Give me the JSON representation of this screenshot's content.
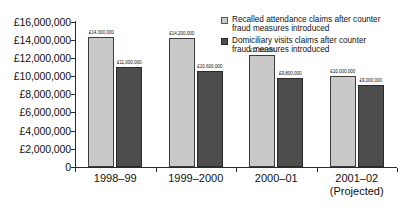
{
  "chart_data": {
    "type": "bar",
    "title": "",
    "xlabel": "",
    "ylabel": "",
    "ylim": [
      0,
      16000000
    ],
    "grid": false,
    "legend_position": "top-right",
    "categories": [
      "1998–99",
      "1999–2000",
      "2000–01",
      "2001–02 (Projected)"
    ],
    "category_lines": [
      [
        "1998–99"
      ],
      [
        "1999–2000"
      ],
      [
        "2000–01"
      ],
      [
        "2001–02",
        "(Projected)"
      ]
    ],
    "ytick_labels": [
      "£16,000,000",
      "£14,000,000",
      "£12,000,000",
      "£10,000,000",
      "£8,000,000",
      "£6,000,000",
      "£4,000,000",
      "£2,000,000",
      "0"
    ],
    "ytick_values": [
      16000000,
      14000000,
      12000000,
      10000000,
      8000000,
      6000000,
      4000000,
      2000000,
      0
    ],
    "series": [
      {
        "name": "Recalled attendance claims after counter fraud measures introduced",
        "color": "#c9c9c9",
        "values": [
          14300000,
          14200000,
          12300000,
          10000000
        ],
        "labels": [
          "£14,300,000",
          "£14,200,000",
          "£12,300,000",
          "£10,000,000"
        ]
      },
      {
        "name": "Domiciliary visits claims after counter fraud measures introduced",
        "color": "#4d4d4d",
        "values": [
          11000000,
          10600000,
          9800000,
          9000000
        ],
        "labels": [
          "£11,000,000",
          "£10,600,000",
          "£9,800,000",
          "£9,000,000"
        ]
      }
    ]
  },
  "legend": {
    "items": [
      {
        "label": "Recalled attendance claims after counter fraud measures introduced",
        "swatch": "light"
      },
      {
        "label": "Domiciliary visits claims after counter fraud measures introduced",
        "swatch": "dark"
      }
    ]
  }
}
